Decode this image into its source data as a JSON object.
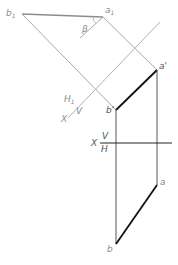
{
  "diagram": {
    "type": "descriptive-geometry-auxiliary-projection",
    "colors": {
      "construction": "#a8a8a8",
      "auxiliary_axis": "#b0b0b0",
      "true_length": "#8c8c8c",
      "projection": "#444444",
      "segment": "#111111",
      "label": "#8a8a8a"
    },
    "labels": {
      "b1": "b",
      "b1_sub": "1",
      "a1": "a",
      "a1_sub": "1",
      "beta": "β",
      "h1": "H",
      "h1_sub": "1",
      "x1": "X",
      "v1": "V",
      "a_prime": "a'",
      "b_prime": "b'",
      "x": "X",
      "v": "V",
      "h": "H",
      "a": "a",
      "b": "b"
    },
    "points": {
      "b1": [
        22,
        14
      ],
      "a1": [
        103,
        17
      ],
      "a_prime": [
        157,
        70
      ],
      "b_prime": [
        116,
        110
      ],
      "a": [
        157,
        185
      ],
      "b": [
        116,
        244
      ]
    },
    "axes": {
      "x1_axis": {
        "from": [
          160,
          22
        ],
        "to": [
          68,
          118
        ]
      },
      "x_axis": {
        "from": [
          100,
          143
        ],
        "to": [
          172,
          143
        ]
      }
    }
  }
}
